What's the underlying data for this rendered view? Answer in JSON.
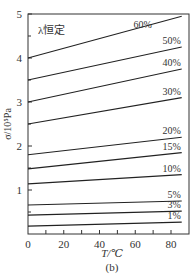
{
  "chart_data": {
    "type": "line",
    "title": "",
    "annotation": "λ恒定",
    "caption": "(b)",
    "xlabel": "T/℃",
    "ylabel": "σ/10⁵Pa",
    "xlim": [
      0,
      90
    ],
    "ylim": [
      0,
      5
    ],
    "x_ticks": [
      0,
      20,
      40,
      60,
      80
    ],
    "x_minor_ticks": [
      10,
      30,
      50,
      70
    ],
    "y_ticks": [
      1,
      2,
      3,
      4,
      5
    ],
    "grid": false,
    "legend": "inline labels at right end of each line",
    "x": [
      0,
      86
    ],
    "series": [
      {
        "name": "60%",
        "values": [
          4.0,
          4.95
        ]
      },
      {
        "name": "50%",
        "values": [
          3.5,
          4.25
        ]
      },
      {
        "name": "40%",
        "values": [
          3.0,
          3.75
        ]
      },
      {
        "name": "30%",
        "values": [
          2.5,
          3.1
        ]
      },
      {
        "name": "20%",
        "values": [
          1.8,
          2.2
        ]
      },
      {
        "name": "15%",
        "values": [
          1.48,
          1.85
        ]
      },
      {
        "name": "10%",
        "values": [
          1.14,
          1.35
        ]
      },
      {
        "name": "5%",
        "values": [
          0.66,
          0.75
        ]
      },
      {
        "name": "3%",
        "values": [
          0.43,
          0.52
        ]
      },
      {
        "name": "1%",
        "values": [
          0.18,
          0.27
        ]
      }
    ]
  },
  "colors": {
    "line": "#222222",
    "frame": "#333333"
  }
}
